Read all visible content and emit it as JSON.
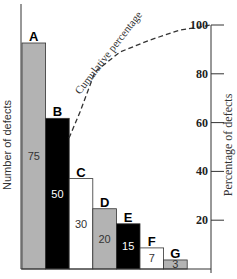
{
  "chart_data": {
    "type": "bar",
    "subtype": "pareto",
    "title": "",
    "categories": [
      "A",
      "B",
      "C",
      "D",
      "E",
      "F",
      "G"
    ],
    "values": [
      75,
      50,
      30,
      20,
      15,
      7,
      3
    ],
    "bar_colors": [
      "#b3b3b3",
      "#000000",
      "#ffffff",
      "#b3b3b3",
      "#000000",
      "#ffffff",
      "#b3b3b3"
    ],
    "value_label_colors": [
      "#333333",
      "#ffffff",
      "#333333",
      "#333333",
      "#ffffff",
      "#333333",
      "#333333"
    ],
    "ylabel": "Number of defects",
    "y2label": "Percentage of defects",
    "y2_ticks": [
      "20",
      "40",
      "60",
      "80",
      "100"
    ],
    "y2lim": [
      0,
      100
    ],
    "cumulative_line": {
      "label": "Cumulative percentage",
      "style": "dashed",
      "values": [
        37.5,
        62.5,
        77.5,
        87.5,
        95,
        98.5,
        100
      ]
    },
    "grid": false,
    "legend": "none"
  }
}
